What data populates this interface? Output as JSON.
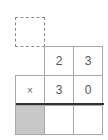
{
  "carry_box": {
    "value": "",
    "style": "dashed"
  },
  "multiplicand": {
    "digits": [
      "2",
      "3"
    ]
  },
  "multiplier": {
    "operator": "×",
    "digits": [
      "3",
      "0"
    ]
  },
  "result": {
    "cells": [
      "",
      "",
      ""
    ],
    "shaded_first": true
  },
  "colors": {
    "border": "#a8a8a8",
    "dashed_border": "#8a8a8a",
    "shaded": "#c8c8c8",
    "rule": "#333333",
    "text": "#555555"
  }
}
